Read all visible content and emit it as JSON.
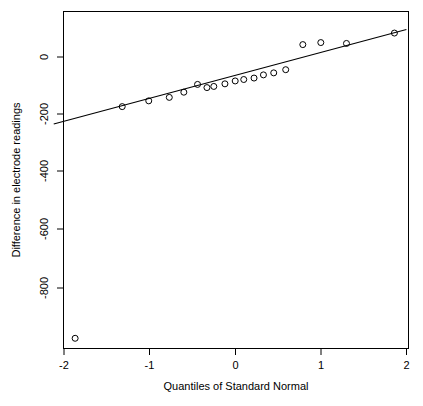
{
  "chart_data": {
    "type": "scatter",
    "title": "",
    "subtitle": "",
    "xlabel": "Quantiles of Standard Normal",
    "ylabel": "Difference in electrode readings",
    "xlim": [
      -2.12,
      2.0
    ],
    "ylim": [
      -1010,
      110
    ],
    "xticks": [
      -2,
      -1,
      0,
      1,
      2
    ],
    "xtick_labels": [
      "-2",
      "-1",
      "0",
      "1",
      "2"
    ],
    "yticks": [
      0,
      -200,
      -400,
      -600,
      -800
    ],
    "ytick_labels": [
      "0",
      "-200",
      "-400",
      "-600",
      "-800"
    ],
    "grid": false,
    "legend": null,
    "point_marker": "open-circle",
    "series": [
      {
        "name": "Sample quantiles",
        "x": [
          -1.87,
          -1.32,
          -1.01,
          -0.77,
          -0.6,
          -0.44,
          -0.33,
          -0.25,
          -0.12,
          0.0,
          0.1,
          0.22,
          0.33,
          0.45,
          0.59,
          0.79,
          1.0,
          1.3,
          1.86
        ],
        "y": [
          -975,
          -172,
          -152,
          -140,
          -122,
          -95,
          -106,
          -102,
          -93,
          -83,
          -78,
          -73,
          -62,
          -55,
          -44,
          43,
          50,
          47,
          83
        ]
      }
    ],
    "reference_line": {
      "name": "qqline",
      "x": [
        -2.12,
        2.0
      ],
      "y": [
        -232,
        95
      ],
      "slope": 79.3,
      "intercept": -64.0
    },
    "annotations": []
  },
  "figure": {
    "frame_visible": true,
    "background_color": "#ffffff",
    "foreground_color": "#000000"
  }
}
